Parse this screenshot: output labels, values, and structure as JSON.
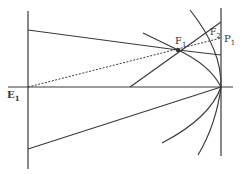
{
  "diagram": {
    "labels": {
      "E1": {
        "main": "E",
        "sub": "1"
      },
      "F1": {
        "main": "F",
        "sub": "1"
      },
      "F2": {
        "main": "F",
        "sub": "2"
      },
      "P1": {
        "main": "P",
        "sub": "1"
      }
    },
    "colors": {
      "stroke": "#3a3a3a",
      "background": "#ffffff"
    }
  }
}
